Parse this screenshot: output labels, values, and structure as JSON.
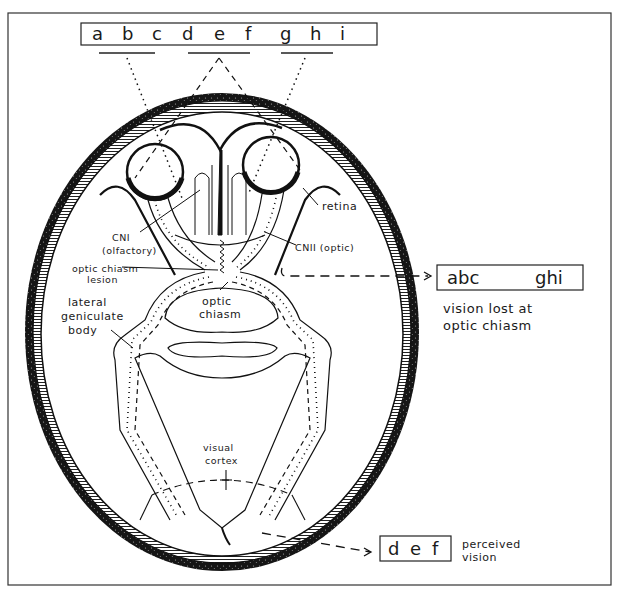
{
  "diagram": {
    "visual_field": {
      "letters": [
        "a",
        "b",
        "c",
        "d",
        "e",
        "f",
        "g",
        "h",
        "i"
      ]
    },
    "labels": {
      "retina": "retina",
      "cn1_line1": "CNI",
      "cn1_line2": "(olfactory)",
      "cn2": "CNII (optic)",
      "lesion_line1": "optic chiasm",
      "lesion_line2": "lesion",
      "chiasm_line1": "optic",
      "chiasm_line2": "chiasm",
      "lgb_line1": "lateral",
      "lgb_line2": "geniculate",
      "lgb_line3": "body",
      "cortex_line1": "visual",
      "cortex_line2": "cortex"
    },
    "lost_box": {
      "left": "abc",
      "right": "ghi",
      "caption_line1": "vision lost at",
      "caption_line2": "optic chiasm"
    },
    "perceived_box": {
      "letters": [
        "d",
        "e",
        "f"
      ],
      "caption_line1": "perceived",
      "caption_line2": "vision"
    },
    "colors": {
      "ink": "#1a1a1a",
      "paper": "#ffffff"
    }
  }
}
